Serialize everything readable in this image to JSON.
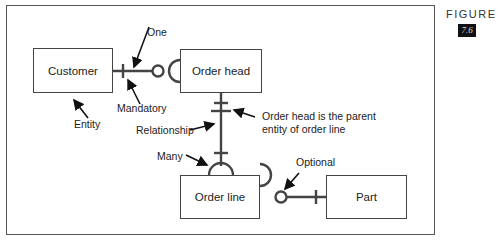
{
  "figure": {
    "label": "FIGURE",
    "number": "7.6"
  },
  "entities": {
    "customer": "Customer",
    "order_head": "Order head",
    "order_line": "Order line",
    "part": "Part"
  },
  "annotations": {
    "one": "One",
    "mandatory": "Mandatory",
    "entity": "Entity",
    "relationship": "Relationship",
    "parent_line1": "Order head is the parent",
    "parent_line2": "entity of order line",
    "many": "Many",
    "optional": "Optional"
  },
  "colors": {
    "line": "#444444",
    "frame": "#555555",
    "text": "#222222"
  }
}
